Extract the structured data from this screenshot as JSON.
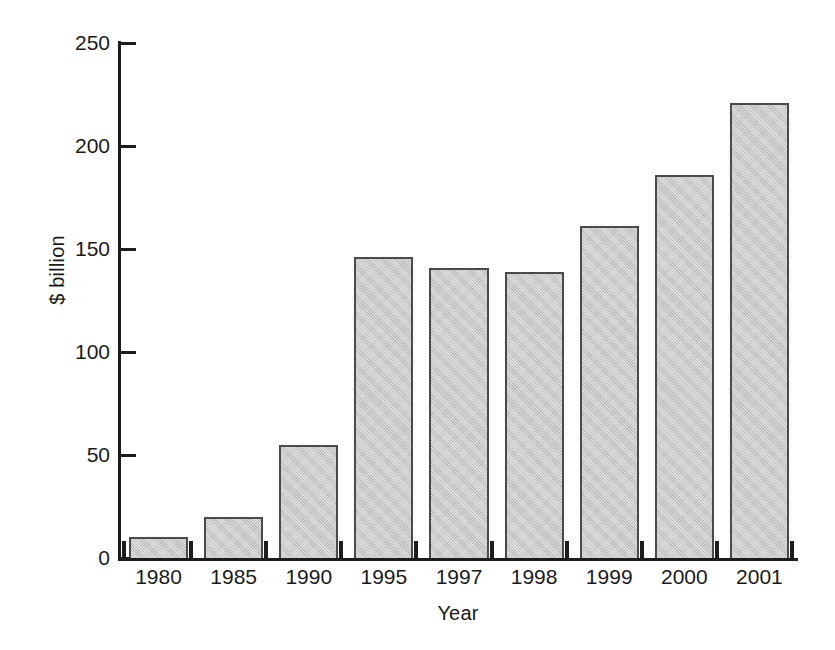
{
  "chart_data": {
    "type": "bar",
    "title": "",
    "xlabel": "Year",
    "ylabel": "$ billion",
    "categories": [
      "1980",
      "1985",
      "1990",
      "1995",
      "1997",
      "1998",
      "1999",
      "2000",
      "2001"
    ],
    "values": [
      10,
      20,
      55,
      146,
      141,
      139,
      161,
      186,
      221
    ],
    "ylim": [
      0,
      250
    ],
    "yticks": [
      0,
      50,
      100,
      150,
      200,
      250
    ],
    "ytick_labels": [
      "0",
      "50",
      "100",
      "150",
      "200",
      "250"
    ],
    "grid": false,
    "legend": false,
    "bar_fill_color": "#c9c9c9",
    "bar_edge_color": "#4a4a4a",
    "axis_color": "#1c1c1c"
  }
}
